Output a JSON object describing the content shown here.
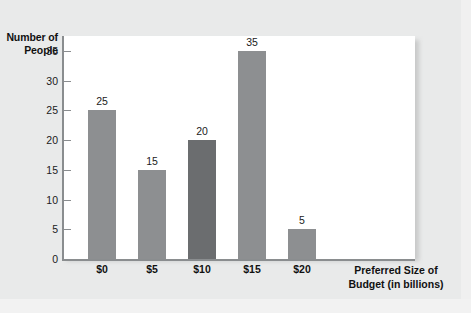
{
  "chart_data": {
    "type": "bar",
    "title": "",
    "xlabel": "Preferred Size of Budget (in billions)",
    "xlabel_line1": "Preferred Size of",
    "xlabel_line2": "Budget (in billions)",
    "ylabel": "Number of People",
    "ylabel_line1": "Number of",
    "ylabel_line2": "People",
    "categories": [
      "$0",
      "$5",
      "$10",
      "$15",
      "$20"
    ],
    "values": [
      25,
      15,
      20,
      35,
      5
    ],
    "value_labels": [
      "25",
      "15",
      "20",
      "35",
      "5"
    ],
    "bar_colors": [
      "#8d8f91",
      "#8d8f91",
      "#6b6d6f",
      "#8d8f91",
      "#8d8f91"
    ],
    "highlighted_category": "$10",
    "ylim": [
      0,
      37.5
    ],
    "yticks": [
      0,
      5,
      10,
      15,
      20,
      25,
      30,
      35
    ],
    "ytick_labels": [
      "0",
      "5",
      "10",
      "15",
      "20",
      "25",
      "30",
      "35"
    ],
    "grid": false,
    "legend": false,
    "plot_background": "#ffffff",
    "page_background": "#e9eaea",
    "axis_color": "#8a8d8f",
    "text_color": "#111111"
  }
}
